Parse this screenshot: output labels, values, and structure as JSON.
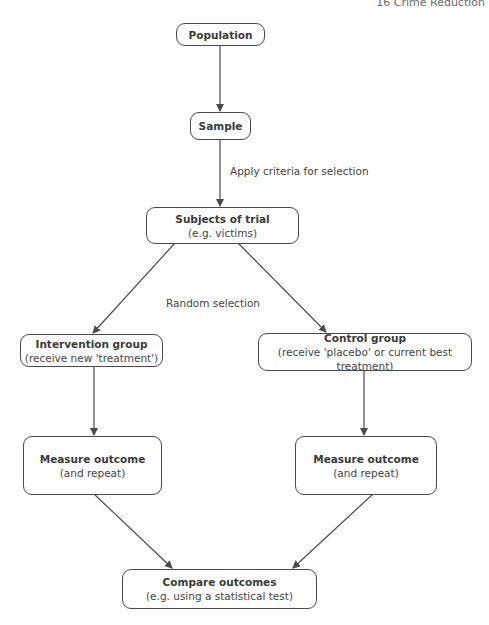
{
  "header": {
    "running_title": "16 Crime Reduction"
  },
  "nodes": {
    "population": {
      "title": "Population"
    },
    "sample": {
      "title": "Sample"
    },
    "subjects": {
      "title": "Subjects of trial",
      "sub": "(e.g. victims)"
    },
    "intervention": {
      "title": "Intervention group",
      "sub": "(receive new 'treatment')"
    },
    "control": {
      "title": "Control group",
      "sub": "(receive 'placebo' or current best treatment)"
    },
    "measure_left": {
      "title": "Measure outcome",
      "sub": "(and repeat)"
    },
    "measure_right": {
      "title": "Measure outcome",
      "sub": "(and repeat)"
    },
    "compare": {
      "title": "Compare outcomes",
      "sub": "(e.g. using a statistical test)"
    }
  },
  "edge_labels": {
    "criteria": "Apply criteria for selection",
    "random": "Random selection"
  },
  "colors": {
    "line": "#4a4a4a",
    "text": "#3a3a3a",
    "background": "#ffffff"
  }
}
